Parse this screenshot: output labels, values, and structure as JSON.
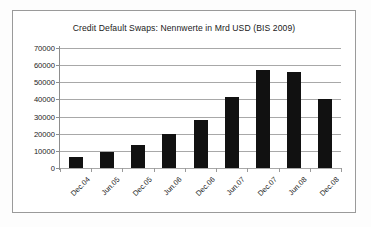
{
  "chart_data": {
    "type": "bar",
    "title": "Credit Default Swaps: Nennwerte in Mrd USD (BIS 2009)",
    "xlabel": "",
    "ylabel": "",
    "categories": [
      "Dec.04",
      "Jun.05",
      "Dec.05",
      "Jun.06",
      "Dec.06",
      "Jun.07",
      "Dec.07",
      "Jun.08",
      "Dec.08"
    ],
    "values": [
      6400,
      9500,
      13500,
      19700,
      27800,
      41600,
      57000,
      55900,
      40500
    ],
    "ylim": [
      0,
      70000
    ],
    "ytick_labels": [
      "70000",
      "60000",
      "50000",
      "40000",
      "30000",
      "20000",
      "10000",
      "0"
    ],
    "ytick_values": [
      70000,
      60000,
      50000,
      40000,
      30000,
      20000,
      10000,
      0
    ],
    "grid": true,
    "legend": null,
    "bar_color": "#111111",
    "grid_color": "#a8a8a8",
    "frame_color": "#9a9a9a",
    "background_color": "#ffffff"
  }
}
